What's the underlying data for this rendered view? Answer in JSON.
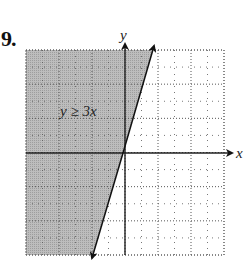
{
  "problem": {
    "number": "9."
  },
  "chart_data": {
    "type": "inequality-graph",
    "title": "",
    "inequality_label": "y ≥ 3x",
    "xlabel": "x",
    "ylabel": "y",
    "xlim": [
      -6,
      6
    ],
    "ylim": [
      -6,
      6
    ],
    "grid": true,
    "grid_style": "dotted",
    "boundary_line": {
      "equation": "y = 3x",
      "style": "solid",
      "arrows": "both"
    },
    "shaded_region": "left/above of line y = 3x",
    "colors": {
      "shade": "#b8b8b8",
      "axis": "#222222",
      "grid": "#555555"
    }
  }
}
